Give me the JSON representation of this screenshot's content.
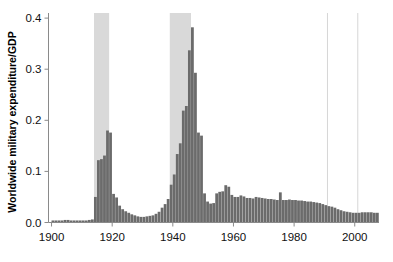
{
  "chart_data": {
    "type": "bar",
    "title": "",
    "subtitle": "",
    "xlabel": "",
    "ylabel": "Worldwide military expenditure/GDP",
    "xlim": [
      1899,
      2008
    ],
    "ylim": [
      0.0,
      0.41
    ],
    "xticks": [
      1900,
      1920,
      1940,
      1960,
      1980,
      2000
    ],
    "xtick_labels": [
      "1900",
      "1920",
      "1940",
      "1960",
      "1980",
      "2000"
    ],
    "yticks": [
      0.0,
      0.1,
      0.2,
      0.3,
      0.4
    ],
    "ytick_labels": [
      "0.0",
      "0.1",
      "0.2",
      "0.3",
      "0.4"
    ],
    "grid": false,
    "legend": null,
    "bar_color": "#6b6b6b",
    "band_color": "#d9d9d9",
    "vline_color": "#d6d6d6",
    "axis_color": "#8a8a8a",
    "shaded_bands": [
      {
        "name": "World War I",
        "start": 1914,
        "end": 1918
      },
      {
        "name": "World War II",
        "start": 1939,
        "end": 1945
      }
    ],
    "vertical_lines": [
      {
        "name": "1991",
        "x": 1991
      },
      {
        "name": "2001",
        "x": 2001
      }
    ],
    "categories": [
      1900,
      1901,
      1902,
      1903,
      1904,
      1905,
      1906,
      1907,
      1908,
      1909,
      1910,
      1911,
      1912,
      1913,
      1914,
      1915,
      1916,
      1917,
      1918,
      1919,
      1920,
      1921,
      1922,
      1923,
      1924,
      1925,
      1926,
      1927,
      1928,
      1929,
      1930,
      1931,
      1932,
      1933,
      1934,
      1935,
      1936,
      1937,
      1938,
      1939,
      1940,
      1941,
      1942,
      1943,
      1944,
      1945,
      1946,
      1947,
      1948,
      1949,
      1950,
      1951,
      1952,
      1953,
      1954,
      1955,
      1956,
      1957,
      1958,
      1959,
      1960,
      1961,
      1962,
      1963,
      1964,
      1965,
      1966,
      1967,
      1968,
      1969,
      1970,
      1971,
      1972,
      1973,
      1974,
      1975,
      1976,
      1977,
      1978,
      1979,
      1980,
      1981,
      1982,
      1983,
      1984,
      1985,
      1986,
      1987,
      1988,
      1989,
      1990,
      1991,
      1992,
      1993,
      1994,
      1995,
      1996,
      1997,
      1998,
      1999,
      2000,
      2001,
      2002,
      2003,
      2004,
      2005,
      2006,
      2007
    ],
    "values": [
      0.004,
      0.004,
      0.004,
      0.004,
      0.005,
      0.005,
      0.004,
      0.004,
      0.004,
      0.004,
      0.004,
      0.004,
      0.005,
      0.006,
      0.05,
      0.122,
      0.124,
      0.131,
      0.18,
      0.176,
      0.056,
      0.049,
      0.033,
      0.026,
      0.022,
      0.019,
      0.016,
      0.014,
      0.012,
      0.011,
      0.011,
      0.012,
      0.013,
      0.014,
      0.017,
      0.021,
      0.029,
      0.036,
      0.046,
      0.074,
      0.094,
      0.134,
      0.155,
      0.219,
      0.228,
      0.337,
      0.382,
      0.293,
      0.176,
      0.17,
      0.057,
      0.041,
      0.037,
      0.038,
      0.057,
      0.06,
      0.061,
      0.073,
      0.07,
      0.054,
      0.05,
      0.05,
      0.053,
      0.051,
      0.048,
      0.048,
      0.047,
      0.05,
      0.049,
      0.048,
      0.047,
      0.046,
      0.046,
      0.045,
      0.044,
      0.059,
      0.044,
      0.044,
      0.045,
      0.044,
      0.044,
      0.043,
      0.043,
      0.042,
      0.041,
      0.041,
      0.04,
      0.039,
      0.038,
      0.036,
      0.034,
      0.032,
      0.031,
      0.029,
      0.026,
      0.024,
      0.022,
      0.021,
      0.02,
      0.019,
      0.019,
      0.019,
      0.02,
      0.02,
      0.02,
      0.02,
      0.019,
      0.019
    ]
  }
}
